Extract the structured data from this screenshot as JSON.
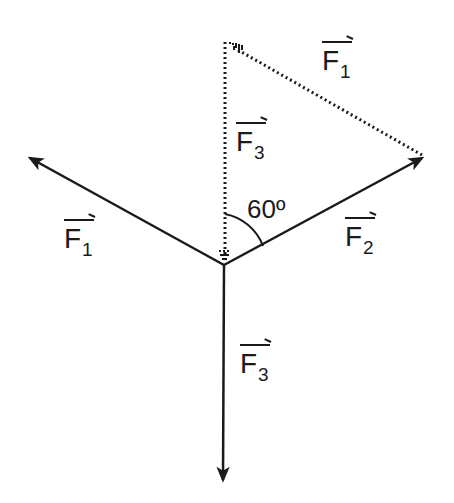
{
  "diagram": {
    "type": "force vector diagram",
    "colors": {
      "ink": "#1a1a1a",
      "background": "#ffffff"
    },
    "origin": [
      224,
      265
    ],
    "vectors": [
      {
        "id": "F1",
        "label": "F",
        "subscript": "1",
        "tip": [
          27,
          156
        ],
        "style": "solid"
      },
      {
        "id": "F2",
        "label": "F",
        "subscript": "2",
        "tip": [
          425,
          156
        ],
        "style": "solid"
      },
      {
        "id": "F3",
        "label": "F",
        "subscript": "3",
        "tip": [
          223,
          483
        ],
        "style": "solid"
      },
      {
        "id": "F3-translated",
        "label": "F",
        "subscript": "3",
        "from": [
          225,
          42
        ],
        "to": [
          225,
          262
        ],
        "style": "dotted",
        "direction": "down"
      },
      {
        "id": "F1-translated",
        "label": "F",
        "subscript": "1",
        "from": [
          425,
          156
        ],
        "to": [
          230,
          44
        ],
        "style": "dotted",
        "direction": "up-left"
      }
    ],
    "angle": {
      "label": "60º",
      "between": [
        "F3-translated",
        "F2"
      ]
    }
  },
  "labels": {
    "f1_left": {
      "letter": "F",
      "sub": "1"
    },
    "f2": {
      "letter": "F",
      "sub": "2"
    },
    "f3_bottom": {
      "letter": "F",
      "sub": "3"
    },
    "f3_dotted": {
      "letter": "F",
      "sub": "3"
    },
    "f1_dotted": {
      "letter": "F",
      "sub": "1"
    },
    "angle": "60º"
  }
}
